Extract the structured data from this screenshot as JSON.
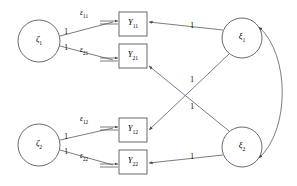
{
  "diagram": {
    "type": "sem-path-diagram",
    "title": "",
    "stroke_color": "#5a5a5a",
    "text_color": "#000000",
    "latent_nodes": [
      {
        "id": "zeta1",
        "label": "ζ",
        "subscript": "1",
        "shape": "circle",
        "cx": 39,
        "cy": 41,
        "r": 21
      },
      {
        "id": "zeta2",
        "label": "ζ",
        "subscript": "2",
        "shape": "circle",
        "cx": 39,
        "cy": 145,
        "r": 21
      },
      {
        "id": "xi1",
        "label": "ξ",
        "subscript": "1",
        "shape": "circle",
        "cx": 242,
        "cy": 38,
        "r": 20
      },
      {
        "id": "xi2",
        "label": "ξ",
        "subscript": "2",
        "shape": "circle",
        "cx": 242,
        "cy": 147,
        "r": 20
      }
    ],
    "observed_nodes": [
      {
        "id": "Y11",
        "label": "Y",
        "subscript": "11",
        "shape": "rect",
        "x": 119,
        "y": 12,
        "w": 28,
        "h": 24
      },
      {
        "id": "Y21",
        "label": "Y",
        "subscript": "21",
        "shape": "rect",
        "x": 119,
        "y": 44,
        "w": 28,
        "h": 24
      },
      {
        "id": "Y12",
        "label": "Y",
        "subscript": "12",
        "shape": "rect",
        "x": 119,
        "y": 118,
        "w": 28,
        "h": 24
      },
      {
        "id": "Y22",
        "label": "Y",
        "subscript": "22",
        "shape": "rect",
        "x": 119,
        "y": 150,
        "w": 28,
        "h": 24
      }
    ],
    "error_terms": [
      {
        "id": "eps11",
        "label": "ε",
        "subscript": "11",
        "x": 84,
        "y": 19
      },
      {
        "id": "eps21",
        "label": "ε",
        "subscript": "21",
        "x": 84,
        "y": 56
      },
      {
        "id": "eps12",
        "label": "ε",
        "subscript": "12",
        "x": 84,
        "y": 125
      },
      {
        "id": "eps22",
        "label": "ε",
        "subscript": "22",
        "x": 84,
        "y": 162
      }
    ],
    "path_coefficients": [
      {
        "id": "zeta1-Y11",
        "value": "1",
        "x": 66,
        "y": 32
      },
      {
        "id": "zeta1-Y21",
        "value": "1",
        "x": 66,
        "y": 46
      },
      {
        "id": "zeta2-Y12",
        "value": "1",
        "x": 66,
        "y": 137
      },
      {
        "id": "zeta2-Y22",
        "value": "1",
        "x": 66,
        "y": 151
      },
      {
        "id": "xi1-Y11",
        "value": "1",
        "x": 192,
        "y": 32
      },
      {
        "id": "xi1-Y12",
        "value": "1",
        "x": 192,
        "y": 78
      },
      {
        "id": "xi2-Y21",
        "value": "1",
        "x": 192,
        "y": 105
      },
      {
        "id": "xi2-Y22",
        "value": "1",
        "x": 192,
        "y": 152
      }
    ],
    "covariance": {
      "id": "xi1-xi2-covariance",
      "style": "double-headed-curved-arrow"
    }
  }
}
